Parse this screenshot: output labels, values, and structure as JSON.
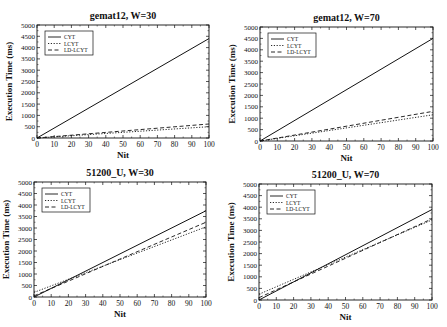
{
  "figure": {
    "panels_layout": "2x2"
  },
  "chart_data": [
    {
      "type": "line",
      "title": "gemat12, W=30",
      "xlabel": "Nit",
      "ylabel": "Execution Time (ms)",
      "xlim": [
        0,
        100
      ],
      "ylim": [
        0,
        5000
      ],
      "xticks": [
        0,
        10,
        20,
        30,
        40,
        50,
        60,
        70,
        80,
        90,
        100
      ],
      "yticks": [
        0,
        500,
        1000,
        1500,
        2000,
        2500,
        3000,
        3500,
        4000,
        4500,
        5000
      ],
      "legend": [
        "CYT",
        "LCYT",
        "LD-LCYT"
      ],
      "legend_position": "upper left",
      "grid": false,
      "x": [
        0,
        100
      ],
      "series": [
        {
          "name": "CYT",
          "style": "solid",
          "values": [
            0,
            4400
          ]
        },
        {
          "name": "LCYT",
          "style": "dotted",
          "values": [
            0,
            500
          ]
        },
        {
          "name": "LD-LCYT",
          "style": "dashed",
          "values": [
            0,
            620
          ]
        }
      ]
    },
    {
      "type": "line",
      "title": "gemat12, W=70",
      "xlabel": "Nit",
      "ylabel": "Execution Time (ms)",
      "xlim": [
        0,
        100
      ],
      "ylim": [
        0,
        5000
      ],
      "xticks": [
        0,
        10,
        20,
        30,
        40,
        50,
        60,
        70,
        80,
        90,
        100
      ],
      "yticks": [
        0,
        500,
        1000,
        1500,
        2000,
        2500,
        3000,
        3500,
        4000,
        4500,
        5000
      ],
      "legend": [
        "CYT",
        "LCYT",
        "LD-LCYT"
      ],
      "legend_position": "upper left",
      "grid": false,
      "x": [
        0,
        100
      ],
      "series": [
        {
          "name": "CYT",
          "style": "solid",
          "values": [
            0,
            4500
          ]
        },
        {
          "name": "LCYT",
          "style": "dotted",
          "values": [
            0,
            1150
          ]
        },
        {
          "name": "LD-LCYT",
          "style": "dashed",
          "values": [
            0,
            1300
          ]
        }
      ]
    },
    {
      "type": "line",
      "title": "51200_U, W=30",
      "xlabel": "Nit",
      "ylabel": "Execution Time (ms)",
      "xlim": [
        0,
        100
      ],
      "ylim": [
        0,
        5000
      ],
      "xticks": [
        0,
        10,
        20,
        30,
        40,
        50,
        60,
        70,
        80,
        90,
        100
      ],
      "yticks": [
        0,
        500,
        1000,
        1500,
        2000,
        2500,
        3000,
        3500,
        4000,
        4500,
        5000
      ],
      "legend": [
        "CYT",
        "LCYT",
        "LD-LCYT"
      ],
      "legend_position": "upper left",
      "grid": false,
      "x": [
        0,
        100
      ],
      "series": [
        {
          "name": "CYT",
          "style": "solid",
          "values": [
            0,
            3750
          ]
        },
        {
          "name": "LCYT",
          "style": "dotted",
          "values": [
            200,
            3050
          ]
        },
        {
          "name": "LD-LCYT",
          "style": "dashed",
          "values": [
            50,
            3250
          ]
        }
      ]
    },
    {
      "type": "line",
      "title": "51200_U, W=70",
      "xlabel": "Nit",
      "ylabel": "Execution Time (ms)",
      "xlim": [
        0,
        100
      ],
      "ylim": [
        0,
        5000
      ],
      "xticks": [
        0,
        10,
        20,
        30,
        40,
        50,
        60,
        70,
        80,
        90,
        100
      ],
      "yticks": [
        0,
        500,
        1000,
        1500,
        2000,
        2500,
        3000,
        3500,
        4000,
        4500,
        5000
      ],
      "legend": [
        "CYT",
        "LCYT",
        "LD-LCYT"
      ],
      "legend_position": "upper left",
      "grid": false,
      "x": [
        0,
        100
      ],
      "series": [
        {
          "name": "CYT",
          "style": "solid",
          "values": [
            0,
            3900
          ]
        },
        {
          "name": "LCYT",
          "style": "dotted",
          "values": [
            250,
            3450
          ]
        },
        {
          "name": "LD-LCYT",
          "style": "dashed",
          "values": [
            100,
            3500
          ]
        }
      ]
    }
  ]
}
